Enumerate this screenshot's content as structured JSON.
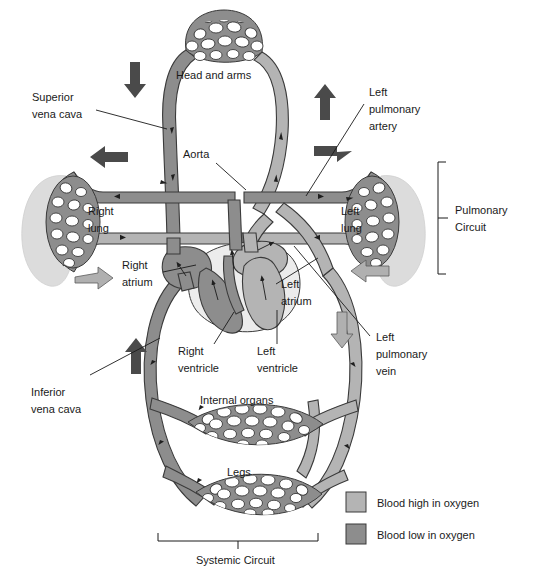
{
  "figure": {
    "background": "#ffffff"
  },
  "colors": {
    "blood_high_oxygen": "#b4b4b4",
    "blood_low_oxygen": "#8d8d8d",
    "outline": "#3a3a3a",
    "text": "#1a1a1a",
    "lung_silhouette": "#dcdcdc",
    "heart_body": "#ececec"
  },
  "labels": {
    "superior_vena_cava": "Superior\nvena cava",
    "superior_vena_cava_l1": "Superior",
    "superior_vena_cava_l2": "vena cava",
    "head_and_arms": "Head and arms",
    "aorta": "Aorta",
    "left_pulmonary_artery_l1": "Left",
    "left_pulmonary_artery_l2": "pulmonary",
    "left_pulmonary_artery_l3": "artery",
    "right_lung_l1": "Right",
    "right_lung_l2": "lung",
    "left_lung_l1": "Left",
    "left_lung_l2": "lung",
    "right_atrium_l1": "Right",
    "right_atrium_l2": "atrium",
    "left_atrium_l1": "Left",
    "left_atrium_l2": "atrium",
    "right_ventricle_l1": "Right",
    "right_ventricle_l2": "ventricle",
    "left_ventricle_l1": "Left",
    "left_ventricle_l2": "ventricle",
    "left_pulmonary_vein_l1": "Left",
    "left_pulmonary_vein_l2": "pulmonary",
    "left_pulmonary_vein_l3": "vein",
    "inferior_vena_cava_l1": "Inferior",
    "inferior_vena_cava_l2": "vena cava",
    "internal_organs": "Internal organs",
    "legs": "Legs",
    "pulmonary_circuit_l1": "Pulmonary",
    "pulmonary_circuit_l2": "Circuit",
    "systemic_circuit": "Systemic Circuit"
  },
  "legend": {
    "items": [
      {
        "label": "Blood high in oxygen",
        "swatch": "#b4b4b4"
      },
      {
        "label": "Blood low in oxygen",
        "swatch": "#8d8d8d"
      }
    ]
  },
  "brackets": {
    "pulmonary_circuit": "Pulmonary Circuit",
    "systemic_circuit": "Systemic Circuit"
  },
  "flow_arrows": [
    {
      "name": "head-down-arrow",
      "direction": "down",
      "style": "dark"
    },
    {
      "name": "head-up-arrow",
      "direction": "up",
      "style": "dark"
    },
    {
      "name": "right-lung-in-arrow",
      "direction": "left",
      "style": "dark"
    },
    {
      "name": "right-lung-out-arrow",
      "direction": "right",
      "style": "light"
    },
    {
      "name": "left-lung-in-arrow",
      "direction": "right",
      "style": "dark"
    },
    {
      "name": "left-lung-out-arrow",
      "direction": "left",
      "style": "light"
    },
    {
      "name": "inferior-vena-cava-up-arrow",
      "direction": "up",
      "style": "dark"
    },
    {
      "name": "descending-aorta-down-arrow",
      "direction": "down",
      "style": "light"
    }
  ],
  "capillary_beds": [
    {
      "name": "head-and-arms",
      "label": "Head and arms"
    },
    {
      "name": "right-lung",
      "label": "Right lung"
    },
    {
      "name": "left-lung",
      "label": "Left lung"
    },
    {
      "name": "internal-organs",
      "label": "Internal organs"
    },
    {
      "name": "legs",
      "label": "Legs"
    }
  ],
  "heart_chambers": [
    {
      "name": "right-atrium",
      "label": "Right atrium"
    },
    {
      "name": "left-atrium",
      "label": "Left atrium"
    },
    {
      "name": "right-ventricle",
      "label": "Right ventricle"
    },
    {
      "name": "left-ventricle",
      "label": "Left ventricle"
    }
  ]
}
